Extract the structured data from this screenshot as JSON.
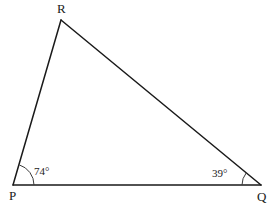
{
  "figure": {
    "type": "triangle-diagram",
    "background_color": "#ffffff",
    "stroke_color": "#1a1a1a",
    "width": 276,
    "height": 207
  },
  "vertices": [
    {
      "id": "P",
      "label": "P",
      "x": 13,
      "y": 185,
      "label_x": 9,
      "label_y": 200
    },
    {
      "id": "Q",
      "label": "Q",
      "x": 261,
      "y": 185,
      "label_x": 257,
      "label_y": 201
    },
    {
      "id": "R",
      "label": "R",
      "x": 61,
      "y": 20,
      "label_x": 57,
      "label_y": 13
    }
  ],
  "sides": [
    {
      "id": "PQ",
      "from": "P",
      "to": "Q"
    },
    {
      "id": "PR",
      "from": "P",
      "to": "R"
    },
    {
      "id": "RQ",
      "from": "R",
      "to": "Q"
    }
  ],
  "angles": [
    {
      "at": "P",
      "value": 74,
      "label": "74°",
      "label_x": 34,
      "label_y": 175,
      "arc_radius": 21,
      "arc_path": "M 34 185 A 21 21 0 0 0 19.3 164.9"
    },
    {
      "at": "Q",
      "value": 39,
      "label": "39°",
      "label_x": 212,
      "label_y": 177,
      "arc_radius": 19,
      "arc_path": "M 242 185 A 19 19 0 0 1 246.2 173.0"
    }
  ]
}
